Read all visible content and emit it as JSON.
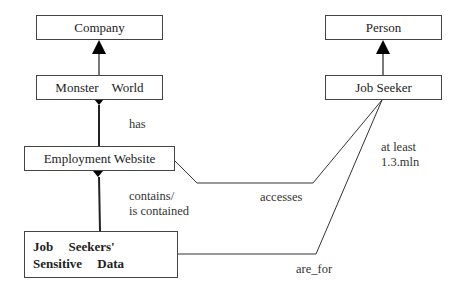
{
  "diagram": {
    "type": "class-diagram",
    "classes": [
      {
        "id": "company",
        "label": "Company"
      },
      {
        "id": "monster_world",
        "label": "Monster    World"
      },
      {
        "id": "employment_website",
        "label": "Employment Website"
      },
      {
        "id": "sensitive_data",
        "label": "Job Seekers' Sensitive Data"
      },
      {
        "id": "person",
        "label": "Person"
      },
      {
        "id": "job_seeker",
        "label": "Job Seeker"
      }
    ],
    "relations": [
      {
        "from": "monster_world",
        "to": "company",
        "kind": "generalization",
        "label": ""
      },
      {
        "from": "job_seeker",
        "to": "person",
        "kind": "generalization",
        "label": ""
      },
      {
        "from": "employment_website",
        "to": "monster_world",
        "kind": "composition",
        "label": "has"
      },
      {
        "from": "sensitive_data",
        "to": "employment_website",
        "kind": "composition",
        "label": "contains/\nis contained"
      },
      {
        "from": "employment_website",
        "to": "job_seeker",
        "kind": "association",
        "label": "accesses"
      },
      {
        "from": "sensitive_data",
        "to": "job_seeker",
        "kind": "association",
        "label": "are_for"
      }
    ],
    "annotations": [
      {
        "near": "job_seeker",
        "text": "at least\n1.3.mln"
      }
    ]
  }
}
